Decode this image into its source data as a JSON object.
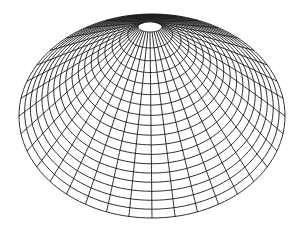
{
  "chart_data": {
    "type": "surface-wireframe",
    "title": "",
    "xlabel": "",
    "ylabel": "",
    "zlabel": "",
    "grid": false,
    "mesh": {
      "radial_lines": 36,
      "rings": 18,
      "outer_center": [
        152,
        116
      ],
      "outer_rx": 133,
      "outer_ry": 102,
      "apex": [
        150,
        27
      ],
      "apex_rx": 12,
      "apex_ry": 5,
      "line_color": "#1a1a1a"
    }
  }
}
